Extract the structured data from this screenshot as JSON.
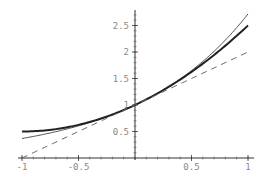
{
  "chart_data": {
    "type": "line",
    "title": "",
    "xlabel": "",
    "ylabel": "",
    "xlim": [
      -1,
      1
    ],
    "ylim": [
      0,
      2.72
    ],
    "grid": false,
    "legend": null,
    "x_ticks": [
      -1,
      -0.5,
      0.5,
      1
    ],
    "x_tick_labels": [
      "-1",
      "-0.5",
      "0.5",
      "1"
    ],
    "y_ticks": [
      0.5,
      1,
      1.5,
      2,
      2.5
    ],
    "y_tick_labels": [
      "0.5",
      "1",
      "1.5",
      "2",
      "2.5"
    ],
    "series": [
      {
        "name": "exp(x)",
        "style": "thin solid",
        "color": "#555555",
        "x": [
          -1,
          -0.5,
          0,
          0.5,
          1
        ],
        "values": [
          0.368,
          0.607,
          1.0,
          1.649,
          2.718
        ]
      },
      {
        "name": "1 + x + x^2/2",
        "style": "thick solid",
        "color": "#222222",
        "x": [
          -1,
          -0.5,
          0,
          0.5,
          1
        ],
        "values": [
          0.5,
          0.625,
          1.0,
          1.625,
          2.5
        ]
      },
      {
        "name": "1 + x",
        "style": "dashed",
        "color": "#666666",
        "x": [
          -1,
          1
        ],
        "values": [
          0,
          2
        ]
      }
    ]
  }
}
